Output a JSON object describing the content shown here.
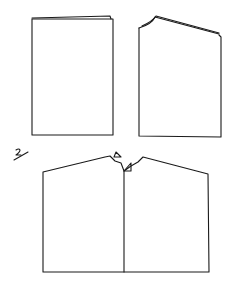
{
  "diagram": {
    "type": "hand-drawn garment pattern sketch",
    "step_label": "2",
    "figures": [
      {
        "id": "panel-flat-top",
        "description": "rectangular panel with slightly folded top edge"
      },
      {
        "id": "panel-sloped-top",
        "description": "rectangular panel with curved neck corner and sloped folded shoulder"
      },
      {
        "id": "garment-front",
        "description": "wide body with sloped shoulders, center neck notch with two small triangle markers and a center-front line"
      }
    ],
    "colors": {
      "ink": "#1a1a1a",
      "paper": "#ffffff"
    }
  }
}
